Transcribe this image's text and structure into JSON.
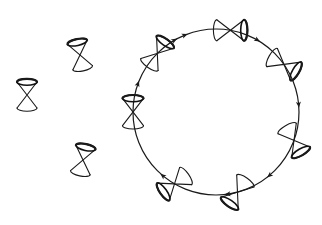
{
  "figure": {
    "colors": {
      "ink": "#1a1a1a",
      "background": "#ffffff"
    }
  },
  "free_cones": [
    {
      "id": "free-cone-1",
      "cx": 80,
      "cy": 55,
      "tilt": -12
    },
    {
      "id": "free-cone-2",
      "cx": 27,
      "cy": 95,
      "tilt": 0
    },
    {
      "id": "free-cone-3",
      "cx": 83,
      "cy": 160,
      "tilt": 12
    }
  ],
  "loop": {
    "cx": 216,
    "cy": 112,
    "r": 83,
    "direction": "clockwise",
    "arrow_angles_deg": [
      -112,
      -60,
      -5,
      50,
      82,
      130,
      200,
      240
    ],
    "cones": [
      {
        "id": "loop-cone-left",
        "angle": 180,
        "tilt": 0
      },
      {
        "id": "loop-cone-upper-left",
        "angle": 225,
        "tilt": 35
      },
      {
        "id": "loop-cone-top",
        "angle": 280,
        "tilt": 90
      },
      {
        "id": "loop-cone-upper-right",
        "angle": 325,
        "tilt": 120
      },
      {
        "id": "loop-cone-right",
        "angle": 20,
        "tilt": 150
      },
      {
        "id": "loop-cone-lower-right",
        "angle": 75,
        "tilt": 215
      },
      {
        "id": "loop-cone-lower-left",
        "angle": 120,
        "tilt": 235
      }
    ]
  }
}
